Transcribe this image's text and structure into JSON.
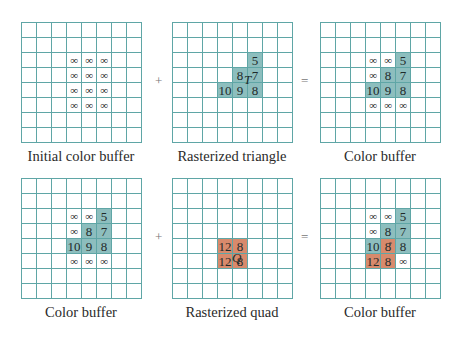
{
  "colors": {
    "grid_line": "#5fa6a6",
    "triangle_fill": "#8dbebe",
    "quad_fill": "#d88a6c"
  },
  "operators": {
    "plus": "+",
    "equals": "="
  },
  "panels": [
    {
      "id": "initial",
      "caption": "Initial color buffer",
      "x": 21,
      "y": 22,
      "caption_y": 148,
      "cells": [
        {
          "r": 2,
          "c": 3,
          "v": "∞"
        },
        {
          "r": 2,
          "c": 4,
          "v": "∞"
        },
        {
          "r": 2,
          "c": 5,
          "v": "∞"
        },
        {
          "r": 3,
          "c": 3,
          "v": "∞"
        },
        {
          "r": 3,
          "c": 4,
          "v": "∞"
        },
        {
          "r": 3,
          "c": 5,
          "v": "∞"
        },
        {
          "r": 4,
          "c": 3,
          "v": "∞"
        },
        {
          "r": 4,
          "c": 4,
          "v": "∞"
        },
        {
          "r": 4,
          "c": 5,
          "v": "∞"
        },
        {
          "r": 5,
          "c": 3,
          "v": "∞"
        },
        {
          "r": 5,
          "c": 4,
          "v": "∞"
        },
        {
          "r": 5,
          "c": 5,
          "v": "∞"
        }
      ]
    },
    {
      "id": "triangle",
      "caption": "Rasterized triangle",
      "x": 172,
      "y": 22,
      "caption_y": 148,
      "shape_label": "T",
      "cells": [
        {
          "r": 2,
          "c": 5,
          "v": "5",
          "f": "t"
        },
        {
          "r": 3,
          "c": 4,
          "v": "8",
          "f": "t"
        },
        {
          "r": 3,
          "c": 5,
          "v": "7",
          "f": "t"
        },
        {
          "r": 4,
          "c": 3,
          "v": "10",
          "f": "t"
        },
        {
          "r": 4,
          "c": 4,
          "v": "9",
          "f": "t"
        },
        {
          "r": 4,
          "c": 5,
          "v": "8",
          "f": "t"
        }
      ]
    },
    {
      "id": "result1",
      "caption": "Color buffer",
      "x": 320,
      "y": 22,
      "caption_y": 148,
      "cells": [
        {
          "r": 2,
          "c": 3,
          "v": "∞"
        },
        {
          "r": 2,
          "c": 4,
          "v": "∞"
        },
        {
          "r": 2,
          "c": 5,
          "v": "5",
          "f": "t"
        },
        {
          "r": 3,
          "c": 3,
          "v": "∞"
        },
        {
          "r": 3,
          "c": 4,
          "v": "8",
          "f": "t"
        },
        {
          "r": 3,
          "c": 5,
          "v": "7",
          "f": "t"
        },
        {
          "r": 4,
          "c": 3,
          "v": "10",
          "f": "t"
        },
        {
          "r": 4,
          "c": 4,
          "v": "9",
          "f": "t"
        },
        {
          "r": 4,
          "c": 5,
          "v": "8",
          "f": "t"
        },
        {
          "r": 5,
          "c": 3,
          "v": "∞"
        },
        {
          "r": 5,
          "c": 4,
          "v": "∞"
        },
        {
          "r": 5,
          "c": 5,
          "v": "∞"
        }
      ]
    },
    {
      "id": "buffer2",
      "caption": "Color buffer",
      "x": 21,
      "y": 178,
      "caption_y": 304,
      "cells": [
        {
          "r": 2,
          "c": 3,
          "v": "∞"
        },
        {
          "r": 2,
          "c": 4,
          "v": "∞"
        },
        {
          "r": 2,
          "c": 5,
          "v": "5",
          "f": "t"
        },
        {
          "r": 3,
          "c": 3,
          "v": "∞"
        },
        {
          "r": 3,
          "c": 4,
          "v": "8",
          "f": "t"
        },
        {
          "r": 3,
          "c": 5,
          "v": "7",
          "f": "t"
        },
        {
          "r": 4,
          "c": 3,
          "v": "10",
          "f": "t"
        },
        {
          "r": 4,
          "c": 4,
          "v": "9",
          "f": "t"
        },
        {
          "r": 4,
          "c": 5,
          "v": "8",
          "f": "t"
        },
        {
          "r": 5,
          "c": 3,
          "v": "∞"
        },
        {
          "r": 5,
          "c": 4,
          "v": "∞"
        },
        {
          "r": 5,
          "c": 5,
          "v": "∞"
        }
      ]
    },
    {
      "id": "quad",
      "caption": "Rasterized quad",
      "x": 172,
      "y": 178,
      "caption_y": 304,
      "shape_label": "Q",
      "cells": [
        {
          "r": 4,
          "c": 3,
          "v": "12",
          "f": "q"
        },
        {
          "r": 4,
          "c": 4,
          "v": "8",
          "f": "q"
        },
        {
          "r": 5,
          "c": 3,
          "v": "12",
          "f": "q"
        },
        {
          "r": 5,
          "c": 4,
          "v": "8",
          "f": "q"
        }
      ]
    },
    {
      "id": "result2",
      "caption": "Color buffer",
      "x": 320,
      "y": 178,
      "caption_y": 304,
      "cells": [
        {
          "r": 2,
          "c": 3,
          "v": "∞"
        },
        {
          "r": 2,
          "c": 4,
          "v": "∞"
        },
        {
          "r": 2,
          "c": 5,
          "v": "5",
          "f": "t"
        },
        {
          "r": 3,
          "c": 3,
          "v": "∞"
        },
        {
          "r": 3,
          "c": 4,
          "v": "8",
          "f": "t"
        },
        {
          "r": 3,
          "c": 5,
          "v": "7",
          "f": "t"
        },
        {
          "r": 4,
          "c": 3,
          "v": "10",
          "f": "t"
        },
        {
          "r": 4,
          "c": 4,
          "v": "8",
          "f": "q",
          "sup": "*"
        },
        {
          "r": 4,
          "c": 5,
          "v": "8",
          "f": "t"
        },
        {
          "r": 5,
          "c": 3,
          "v": "12",
          "f": "q"
        },
        {
          "r": 5,
          "c": 4,
          "v": "8",
          "f": "q"
        },
        {
          "r": 5,
          "c": 5,
          "v": "∞"
        }
      ]
    }
  ]
}
